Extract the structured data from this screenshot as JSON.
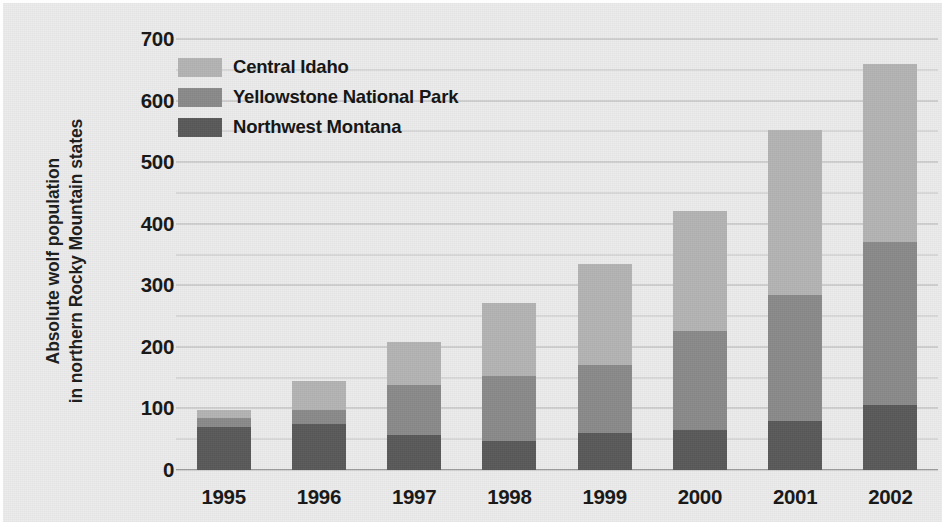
{
  "chart_data": {
    "type": "bar",
    "stacked": true,
    "title": "",
    "xlabel": "",
    "ylabel": "Absolute wolf population in northern Rocky Mountain states",
    "ylabel_lines": [
      "Absolute wolf population",
      "in northern Rocky Mountain states"
    ],
    "categories": [
      "1995",
      "1996",
      "1997",
      "1998",
      "1999",
      "2000",
      "2001",
      "2002"
    ],
    "series": [
      {
        "name": "Northwest Montana",
        "color": "#595959",
        "values": [
          70,
          75,
          57,
          47,
          60,
          65,
          80,
          105
        ]
      },
      {
        "name": "Yellowstone National Park",
        "color": "#8a8a8a",
        "values": [
          15,
          23,
          81,
          105,
          110,
          160,
          205,
          265
        ]
      },
      {
        "name": "Central Idaho",
        "color": "#b4b4b4",
        "values": [
          13,
          47,
          70,
          120,
          165,
          195,
          267,
          290
        ]
      }
    ],
    "totals": [
      98,
      145,
      208,
      272,
      335,
      420,
      552,
      660
    ],
    "ylim": [
      0,
      700
    ],
    "ytick_labels": [
      "700",
      "600",
      "500",
      "400",
      "300",
      "200",
      "100",
      "0"
    ],
    "ytick_values": [
      700,
      600,
      500,
      400,
      300,
      200,
      100,
      0
    ],
    "gridline_values": [
      700,
      650,
      600,
      550,
      500,
      450,
      400,
      350,
      300,
      250,
      200,
      150,
      100,
      50,
      0
    ],
    "grid": true,
    "grid_interval": 50,
    "legend_position": "top-left",
    "legend_order": [
      "Central Idaho",
      "Yellowstone National Park",
      "Northwest Montana"
    ],
    "background_color": "#ececed",
    "axis_text_color": "#161616"
  }
}
